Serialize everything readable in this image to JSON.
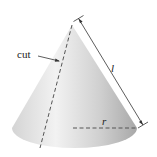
{
  "diagram": {
    "type": "cone",
    "labels": {
      "cut": "cut",
      "slant_height": "l",
      "radius": "r"
    },
    "colors": {
      "cone_light": "#f0f0f0",
      "cone_mid": "#d6d6d6",
      "cone_dark": "#b4b4b4",
      "line": "#333333",
      "text": "#222222"
    }
  }
}
